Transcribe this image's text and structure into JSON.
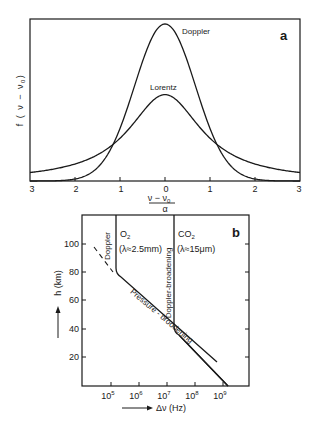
{
  "chart_data": [
    {
      "panel": "a",
      "type": "line",
      "title": "",
      "xlabel": "(ν − ν0) / α",
      "ylabel": "f (ν − ν0)",
      "x_tick_labels": [
        "3",
        "2",
        "1",
        "0",
        "1",
        "2",
        "3"
      ],
      "x_ticks": [
        -3,
        -2,
        -1,
        0,
        1,
        2,
        3
      ],
      "xlim": [
        -3,
        3
      ],
      "grid": false,
      "series": [
        {
          "name": "Doppler",
          "shape": "gaussian",
          "relative_peak": 1.0,
          "x": [
            -3,
            -2,
            -1.5,
            -1,
            -0.5,
            0,
            0.5,
            1,
            1.5,
            2,
            3
          ],
          "values": [
            0.0,
            0.013,
            0.085,
            0.33,
            0.76,
            1.0,
            0.76,
            0.33,
            0.085,
            0.013,
            0.0
          ]
        },
        {
          "name": "Lorentz",
          "shape": "lorentzian",
          "relative_peak": 0.55,
          "x": [
            -3,
            -2,
            -1.5,
            -1,
            -0.5,
            0,
            0.5,
            1,
            1.5,
            2,
            3
          ],
          "values": [
            0.054,
            0.109,
            0.168,
            0.272,
            0.44,
            0.55,
            0.44,
            0.272,
            0.168,
            0.109,
            0.054
          ]
        }
      ],
      "annotations": [
        "Doppler",
        "Lorentz",
        "a"
      ]
    },
    {
      "panel": "b",
      "type": "line",
      "title": "",
      "xlabel": "Δν (Hz)",
      "ylabel": "h (km)",
      "x_scale": "log",
      "x_tick_labels": [
        "10^5",
        "10^6",
        "10^7",
        "10^8",
        "10^9"
      ],
      "y_ticks": [
        20,
        40,
        60,
        80,
        100
      ],
      "ylim": [
        0,
        120
      ],
      "grid": false,
      "series": [
        {
          "name": "O2 (λ ≈ 2.5 mm)",
          "points_log10Hz_km": [
            [
              5.2,
              120
            ],
            [
              5.2,
              82
            ],
            [
              5.4,
              78
            ],
            [
              7.0,
              43
            ],
            [
              7.3,
              36
            ],
            [
              9.1,
              0
            ]
          ]
        },
        {
          "name": "CO2 (λ ≈ 15 μm)",
          "points_log10Hz_km": [
            [
              7.2,
              120
            ],
            [
              7.2,
              40
            ],
            [
              7.3,
              36
            ],
            [
              9.1,
              0
            ]
          ]
        },
        {
          "name": "Doppler extrapolation (dashed)",
          "points_log10Hz_km": [
            [
              4.5,
              97
            ],
            [
              5.2,
              80
            ]
          ]
        }
      ],
      "annotations": [
        "Doppler",
        "Doppler-broadening",
        "Pressure - broodening",
        "O2",
        "(λ≈2.5mm)",
        "CO2",
        "(λ≈15μm)",
        "b"
      ]
    }
  ],
  "panel_a": {
    "label": "a",
    "doppler_label": "Doppler",
    "lorentz_label": "Lorentz",
    "y_axis_label": "f ( ν − ν",
    "y_axis_sub": "0",
    "y_axis_close": ")",
    "x_axis_num": "ν − ν",
    "x_axis_num_sub": "0",
    "x_axis_den": "α",
    "x_ticks": [
      "3",
      "2",
      "1",
      "0",
      "1",
      "2",
      "3"
    ]
  },
  "panel_b": {
    "label": "b",
    "o2_label": "O",
    "o2_sub": "2",
    "o2_wavelength": "(λ≈2.5mm)",
    "co2_label": "CO",
    "co2_sub": "2",
    "co2_wavelength": "(λ≈15μm)",
    "doppler_label": "Doppler",
    "doppler_broadening_label": "Doppler-broadening",
    "pressure_label": "Pressure - broodening",
    "y_axis_label": "h (km)",
    "x_axis_label": "Δν (Hz)",
    "y_ticks": [
      "100",
      "80",
      "60",
      "40",
      "20"
    ],
    "x_ticks_base": [
      "10",
      "10",
      "10",
      "10",
      "10"
    ],
    "x_ticks_exp": [
      "5",
      "6",
      "7",
      "8",
      "9"
    ]
  }
}
